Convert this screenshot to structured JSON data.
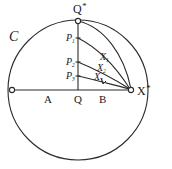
{
  "figure": {
    "curve_name": "C",
    "stroke_color": "#2b2b2b",
    "background_color": "#ffffff",
    "nodes": {
      "top": {
        "label_base": "Q",
        "label_sup": "*"
      },
      "right": {
        "label_base": "X",
        "label_sup": "*"
      },
      "left": {
        "label": ""
      }
    },
    "axis_points": [
      {
        "name": "A",
        "label": "A"
      },
      {
        "name": "Q",
        "label": "Q"
      },
      {
        "name": "B",
        "label": "B"
      }
    ],
    "vertical_points": [
      {
        "name": "P1",
        "base": "P",
        "sub": "1"
      },
      {
        "name": "P2",
        "base": "P",
        "sub": "2"
      },
      {
        "name": "P3",
        "base": "P",
        "sub": "3"
      }
    ],
    "curve_labels": [
      {
        "name": "X1",
        "base": "X",
        "sub": "1"
      },
      {
        "name": "X2",
        "base": "X",
        "sub": "2"
      },
      {
        "name": "X3",
        "base": "X",
        "sub": "3"
      }
    ]
  }
}
